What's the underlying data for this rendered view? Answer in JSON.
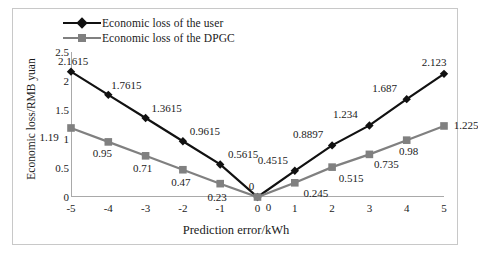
{
  "chart_data": {
    "type": "line",
    "title": "",
    "xlabel": "Prediction error/kWh",
    "ylabel": "Economic loss/RMB yuan",
    "x": [
      -5,
      -4,
      -3,
      -2,
      -1,
      0,
      1,
      2,
      3,
      4,
      5
    ],
    "xticklabels": [
      "-5",
      "-4",
      "-3",
      "-2",
      "-1",
      "0",
      "1",
      "2",
      "3",
      "4",
      "5"
    ],
    "yticklabels": [
      "0",
      "0.5",
      "1",
      "1.5",
      "2",
      "2.5"
    ],
    "yticks": [
      0,
      0.5,
      1,
      1.5,
      2,
      2.5
    ],
    "xlim": [
      -5,
      5
    ],
    "ylim": [
      0,
      2.5
    ],
    "grid": false,
    "legend_position": "top-left",
    "series": [
      {
        "name": "Economic loss of the user",
        "color": "#111111",
        "marker": "diamond",
        "values": [
          2.1615,
          1.7615,
          1.3615,
          0.9615,
          0.5615,
          0,
          0.4515,
          0.8897,
          1.234,
          1.687,
          2.123
        ],
        "labels": [
          "2.1615",
          "1.7615",
          "1.3615",
          "0.9615",
          "0.5615",
          "0",
          "0.4515",
          "0.8897",
          "1.234",
          "1.687",
          "2.123"
        ]
      },
      {
        "name": "Economic loss of the DPGC",
        "color": "#808080",
        "marker": "square",
        "values": [
          1.19,
          0.95,
          0.71,
          0.47,
          0.23,
          0,
          0.245,
          0.515,
          0.735,
          0.98,
          1.225
        ],
        "labels": [
          "1.19",
          "0.95",
          "0.71",
          "0.47",
          "0.23",
          "0",
          "0.245",
          "0.515",
          "0.735",
          "0.98",
          "1.225"
        ]
      }
    ]
  }
}
